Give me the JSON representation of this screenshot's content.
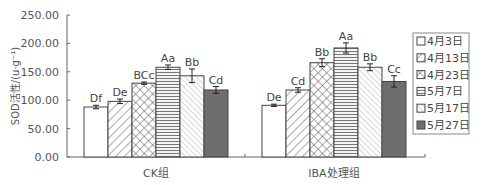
{
  "chart_data": {
    "type": "bar",
    "title": "",
    "xlabel": "",
    "ylabel": "SOD活性/(u·g⁻¹)",
    "ylim": [
      0,
      250
    ],
    "yticks": [
      "0.00",
      "50.00",
      "100.00",
      "150.00",
      "200.00",
      "250.00"
    ],
    "grid": false,
    "legend_position": "right",
    "categories": [
      "CK组",
      "IBA处理组"
    ],
    "series": [
      {
        "name": "4月3日",
        "pattern": "white",
        "values": [
          88,
          91
        ],
        "errors": [
          3,
          2
        ],
        "labels": [
          "Df",
          "De"
        ]
      },
      {
        "name": "4月13日",
        "pattern": "diagonal",
        "values": [
          98,
          118
        ],
        "errors": [
          4,
          4
        ],
        "labels": [
          "De",
          "Cd"
        ]
      },
      {
        "name": "4月23日",
        "pattern": "crosshatch",
        "values": [
          130,
          166
        ],
        "errors": [
          2,
          7
        ],
        "labels": [
          "BCc",
          "Bb"
        ]
      },
      {
        "name": "5月7日",
        "pattern": "horizontal",
        "values": [
          158,
          192
        ],
        "errors": [
          4,
          9
        ],
        "labels": [
          "Aa",
          "Aa"
        ]
      },
      {
        "name": "5月17日",
        "pattern": "fine-diagonal",
        "values": [
          143,
          158
        ],
        "errors": [
          12,
          6
        ],
        "labels": [
          "Bb",
          "Bb"
        ]
      },
      {
        "name": "5月27日",
        "pattern": "dark-gray",
        "values": [
          118,
          133
        ],
        "errors": [
          6,
          10
        ],
        "labels": [
          "Cd",
          "Cc"
        ]
      }
    ]
  }
}
